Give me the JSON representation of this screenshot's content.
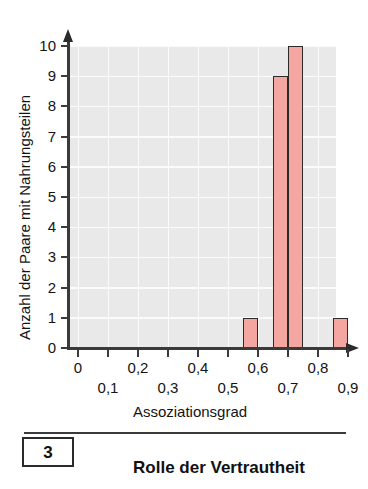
{
  "chart_data": {
    "type": "bar",
    "title": "",
    "xlabel": "Assoziationsgrad",
    "ylabel": "Anzahl der Paare mit Nahrungsteilen",
    "xlim": [
      0,
      0.95
    ],
    "ylim": [
      0,
      10
    ],
    "grid": true,
    "legend": "none",
    "y_ticks": [
      "10",
      "9",
      "8",
      "7",
      "6",
      "5",
      "4",
      "3",
      "2",
      "1",
      "0"
    ],
    "y_tick_values": [
      10,
      9,
      8,
      7,
      6,
      5,
      4,
      3,
      2,
      1,
      0
    ],
    "x_ticks_upper": [
      "0",
      "0,2",
      "0,4",
      "0,6",
      "0,8"
    ],
    "x_tick_values_upper": [
      0.0,
      0.2,
      0.4,
      0.6,
      0.8
    ],
    "x_ticks_lower": [
      "0,1",
      "0,3",
      "0,5",
      "0,7",
      "0,9"
    ],
    "x_tick_values_lower": [
      0.1,
      0.3,
      0.5,
      0.7,
      0.9
    ],
    "bin_width": 0.05,
    "bars": [
      {
        "bin_start": 0.55,
        "bin_end": 0.6,
        "value": 1
      },
      {
        "bin_start": 0.65,
        "bin_end": 0.7,
        "value": 9
      },
      {
        "bin_start": 0.7,
        "bin_end": 0.75,
        "value": 10
      },
      {
        "bin_start": 0.85,
        "bin_end": 0.9,
        "value": 1
      }
    ],
    "categories": [
      "0,55-0,60",
      "0,65-0,70",
      "0,70-0,75",
      "0,85-0,90"
    ],
    "values": [
      1,
      9,
      10,
      1
    ],
    "colors": {
      "bar_fill": "#f4a6a0",
      "bar_stroke": "#2f2a2a",
      "plot_background": "#e9e9e9",
      "gridline": "#fbfbfb",
      "axis": "#3a3a3a",
      "text": "#141414"
    }
  },
  "caption": {
    "number": "3",
    "title": "Rolle der Vertrautheit"
  }
}
